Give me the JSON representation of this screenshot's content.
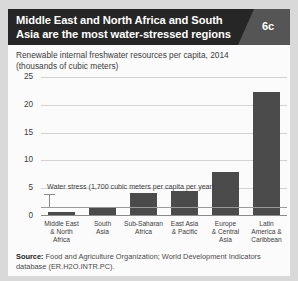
{
  "header": {
    "title": "Middle East and North Africa and South Asia are the most water-stressed regions",
    "badge": "6c"
  },
  "chart_panel": {
    "subtitle_line1": "Renewable internal freshwater resources per capita, 2014",
    "subtitle_line2": "(thousands of cubic meters)"
  },
  "source": {
    "label": "Source:",
    "text": " Food and Agriculture Organization; World Development Indicators database (ER.H2O.INTR.PC)."
  },
  "chart_data": {
    "type": "bar",
    "title": "Renewable internal freshwater resources per capita, 2014",
    "subtitle": "(thousands of cubic meters)",
    "xlabel": "",
    "ylabel": "thousands of cubic meters",
    "ylim": [
      0,
      25
    ],
    "yticks": [
      0,
      5,
      10,
      15,
      20,
      25
    ],
    "ytick_labels": [
      "0",
      "5",
      "10",
      "15",
      "20",
      "25"
    ],
    "grid": true,
    "legend": "none",
    "bar_color": "#4b4b4b",
    "categories": [
      "Middle East & North Africa",
      "South Asia",
      "Sub-Saharan Africa",
      "East Asia & Pacific",
      "Europe & Central Asia",
      "Latin America & Caribbean"
    ],
    "category_labels": [
      [
        "Middle East",
        "& North",
        "Africa"
      ],
      [
        "South",
        "Asia"
      ],
      [
        "Sub-Saharan",
        "Africa"
      ],
      [
        "East Asia",
        "& Pacific"
      ],
      [
        "Europe",
        "& Central",
        "Asia"
      ],
      [
        "Latin",
        "America &",
        "Caribbean"
      ]
    ],
    "values": [
      0.5,
      1.2,
      4.0,
      4.4,
      7.8,
      22.2
    ],
    "annotations": [
      {
        "text": "Water stress (1,700 cubic meters per capita per year)",
        "value": 1.7
      }
    ]
  }
}
